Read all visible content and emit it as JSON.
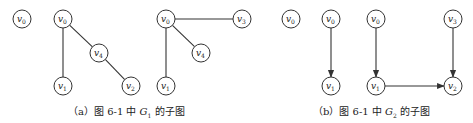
{
  "figure": {
    "panel_a": {
      "caption": {
        "prefix": "（a）图 6-1 中 ",
        "graph": "G",
        "graph_sub": "1",
        "suffix": " 的子图"
      },
      "subgraphs": [
        {
          "nodes": [
            {
              "id": "v0",
              "label": "v",
              "sub": "0",
              "x": 22,
              "y": 19
            }
          ],
          "edges": [],
          "directed": false
        },
        {
          "nodes": [
            {
              "id": "v0",
              "label": "v",
              "sub": "0",
              "x": 63,
              "y": 19
            },
            {
              "id": "v4",
              "label": "v",
              "sub": "4",
              "x": 99,
              "y": 53
            },
            {
              "id": "v1",
              "label": "v",
              "sub": "1",
              "x": 63,
              "y": 86
            },
            {
              "id": "v2",
              "label": "v",
              "sub": "2",
              "x": 131,
              "y": 86
            }
          ],
          "edges": [
            [
              "v0",
              "v1"
            ],
            [
              "v0",
              "v4"
            ],
            [
              "v4",
              "v2"
            ]
          ],
          "directed": false
        },
        {
          "nodes": [
            {
              "id": "v0",
              "label": "v",
              "sub": "0",
              "x": 166,
              "y": 19
            },
            {
              "id": "v3",
              "label": "v",
              "sub": "3",
              "x": 242,
              "y": 19
            },
            {
              "id": "v4",
              "label": "v",
              "sub": "4",
              "x": 201,
              "y": 53
            },
            {
              "id": "v1",
              "label": "v",
              "sub": "1",
              "x": 166,
              "y": 86
            }
          ],
          "edges": [
            [
              "v0",
              "v3"
            ],
            [
              "v0",
              "v4"
            ],
            [
              "v0",
              "v1"
            ]
          ],
          "directed": false
        }
      ]
    },
    "panel_b": {
      "caption": {
        "prefix": "（b）图 6-1 中 ",
        "graph": "G",
        "graph_sub": "2",
        "suffix": " 的子图"
      },
      "subgraphs": [
        {
          "nodes": [
            {
              "id": "v0",
              "label": "v",
              "sub": "0",
              "x": 291,
              "y": 19
            }
          ],
          "edges": [],
          "directed": true
        },
        {
          "nodes": [
            {
              "id": "v0",
              "label": "v",
              "sub": "0",
              "x": 331,
              "y": 19
            },
            {
              "id": "v1",
              "label": "v",
              "sub": "1",
              "x": 331,
              "y": 86
            }
          ],
          "edges": [
            [
              "v0",
              "v1"
            ]
          ],
          "directed": true
        },
        {
          "nodes": [
            {
              "id": "v0",
              "label": "v",
              "sub": "0",
              "x": 376,
              "y": 19
            },
            {
              "id": "v3",
              "label": "v",
              "sub": "3",
              "x": 453,
              "y": 19
            },
            {
              "id": "v1",
              "label": "v",
              "sub": "1",
              "x": 376,
              "y": 86
            },
            {
              "id": "v2",
              "label": "v",
              "sub": "2",
              "x": 453,
              "y": 86
            }
          ],
          "edges": [
            [
              "v0",
              "v1"
            ],
            [
              "v1",
              "v2"
            ],
            [
              "v3",
              "v2"
            ]
          ],
          "directed": true
        }
      ]
    }
  }
}
